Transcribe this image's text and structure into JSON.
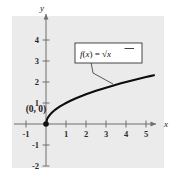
{
  "figure": {
    "background_color": "#ffffff",
    "panel_color": "#ebebeb"
  },
  "chart_data": {
    "type": "line",
    "title": "",
    "xlabel": "x",
    "ylabel": "y",
    "xlim": [
      -1.7,
      5.9
    ],
    "ylim": [
      -2.6,
      4.9
    ],
    "grid": false,
    "legend": "none",
    "xticks": [
      -1,
      1,
      2,
      3,
      4,
      5
    ],
    "xticklabels": [
      "-1",
      "1",
      "2",
      "3",
      "4",
      "5"
    ],
    "yticks": [
      -2,
      -1,
      1,
      2,
      3,
      4
    ],
    "yticklabels": [
      "-2",
      "-1",
      "1",
      "2",
      "3",
      "4"
    ],
    "series": [
      {
        "name": "f(x) = sqrt(x)",
        "equation_display": "f(x) = √x",
        "color": "#0d0d0d",
        "linewidth": 2.1,
        "x": [
          0,
          0.05,
          0.1,
          0.2,
          0.3,
          0.4,
          0.5,
          0.7,
          0.9,
          1.0,
          1.25,
          1.5,
          1.75,
          2.0,
          2.25,
          2.5,
          2.75,
          3.0,
          3.25,
          3.5,
          3.75,
          4.0,
          4.25,
          4.5,
          4.75,
          5.0,
          5.2,
          5.4
        ],
        "y": [
          0,
          0.2236,
          0.3162,
          0.4472,
          0.5477,
          0.6325,
          0.7071,
          0.8367,
          0.9487,
          1.0,
          1.118,
          1.2247,
          1.3229,
          1.4142,
          1.5,
          1.5811,
          1.6583,
          1.7321,
          1.8028,
          1.8708,
          1.9365,
          2.0,
          2.0616,
          2.1213,
          2.1794,
          2.2361,
          2.2804,
          2.3238
        ]
      }
    ],
    "points": [
      {
        "name": "origin-point",
        "x": 0,
        "y": 0,
        "label": "(0, 0)",
        "marker": "filled-circle",
        "color": "#111111"
      }
    ],
    "annotations": [
      {
        "name": "function-callout",
        "text": "f(x) = √x",
        "box": true,
        "box_fill": "#ffffff",
        "box_border": "#333333",
        "anchor_x": 3.35,
        "anchor_y": 1.83
      }
    ],
    "axis_arrows": {
      "x_label": "x",
      "y_label": "y"
    }
  }
}
